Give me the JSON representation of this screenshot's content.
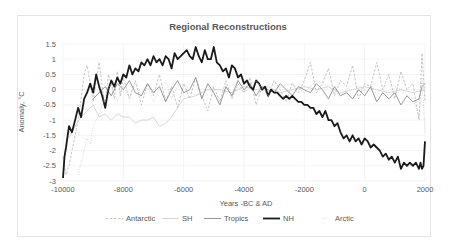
{
  "chart_data": {
    "type": "line",
    "title": "Regional Reconstructions",
    "xlabel": "Years -BC & AD",
    "ylabel": "Anomaly, °C",
    "xlim": [
      -10000,
      2000
    ],
    "ylim": [
      -3,
      1.5
    ],
    "x_ticks": [
      -10000,
      -8000,
      -6000,
      -4000,
      -2000,
      0,
      2000
    ],
    "x_tick_labels": [
      "-10000",
      "-8000",
      "-6000",
      "-4000",
      "-2000",
      "0",
      "2000"
    ],
    "y_ticks": [
      1.5,
      1,
      0.5,
      0,
      -0.5,
      -1,
      -1.5,
      -2,
      -2.5,
      -3
    ],
    "y_tick_labels": [
      "1.5",
      "1",
      "0.5",
      "0",
      "-0.5",
      "-1",
      "-1.5",
      "-2",
      "-2.5",
      "-3"
    ],
    "grid": {
      "horizontal": true,
      "vertical": true,
      "color": "#ececec"
    },
    "legend_position": "bottom",
    "series": [
      {
        "name": "Antarctic",
        "style": "dashed",
        "color": "#b8b8b8",
        "width": 0.8,
        "x": [
          -10000,
          -9900,
          -9800,
          -9700,
          -9600,
          -9500,
          -9400,
          -9300,
          -9200,
          -9100,
          -9000,
          -8900,
          -8800,
          -8700,
          -8600,
          -8500,
          -8400,
          -8300,
          -8200,
          -8100,
          -8000,
          -7800,
          -7600,
          -7400,
          -7200,
          -7000,
          -6800,
          -6600,
          -6400,
          -6200,
          -6000,
          -5800,
          -5600,
          -5400,
          -5200,
          -5000,
          -4800,
          -4600,
          -4400,
          -4200,
          -4000,
          -3800,
          -3600,
          -3400,
          -3200,
          -3000,
          -2800,
          -2600,
          -2400,
          -2200,
          -2000,
          -1800,
          -1600,
          -1400,
          -1200,
          -1000,
          -800,
          -600,
          -400,
          -200,
          0,
          200,
          400,
          600,
          800,
          1000,
          1200,
          1400,
          1600,
          1800,
          1900,
          2000
        ],
        "y": [
          -2.2,
          -2.8,
          -2.5,
          -2.0,
          -1.5,
          -1.0,
          -0.3,
          0.5,
          0.8,
          0.2,
          -0.4,
          0.3,
          0.9,
          0.1,
          -0.6,
          0.5,
          0.2,
          -0.3,
          0.6,
          -0.2,
          0.4,
          -0.3,
          0.3,
          -0.5,
          0.2,
          -0.2,
          0.5,
          -0.4,
          0.1,
          -0.6,
          0.2,
          -0.3,
          0.4,
          -0.2,
          -0.7,
          0.1,
          -0.4,
          0.3,
          -0.3,
          0.2,
          -0.1,
          0.4,
          -0.5,
          0.1,
          -0.2,
          0.3,
          0.0,
          -0.4,
          0.2,
          -0.1,
          0.3,
          0.9,
          -0.1,
          0.2,
          0.7,
          -0.2,
          0.3,
          0.1,
          0.8,
          -0.3,
          0.2,
          0.1,
          0.9,
          0.0,
          0.5,
          -0.3,
          0.6,
          0.0,
          0.2,
          -1.0,
          1.2,
          -0.4
        ]
      },
      {
        "name": "SH",
        "style": "solid",
        "color": "#d3d3d3",
        "width": 0.9,
        "x": [
          -9800,
          -9600,
          -9400,
          -9200,
          -9000,
          -8800,
          -8600,
          -8400,
          -8200,
          -8000,
          -7800,
          -7600,
          -7400,
          -7200,
          -7000,
          -6800,
          -6600,
          -6400,
          -6200,
          -6000,
          -5600,
          -5200,
          -4800,
          -4400,
          -4000,
          -3600,
          -3200,
          -2800,
          -2400,
          -2000,
          -1600,
          -1200,
          -800,
          -400,
          0,
          400,
          800,
          1200,
          1600,
          2000
        ],
        "y": [
          -1.6,
          -1.2,
          -0.9,
          -0.7,
          -0.5,
          -0.9,
          -0.8,
          -1.0,
          -0.8,
          -0.9,
          -0.9,
          -1.1,
          -1.0,
          -1.0,
          -0.9,
          -1.2,
          -1.1,
          -0.9,
          -0.6,
          -0.3,
          -0.2,
          0.0,
          0.0,
          -0.1,
          0.1,
          0.0,
          0.1,
          -0.1,
          0.0,
          0.1,
          0.0,
          0.1,
          -0.1,
          0.0,
          0.1,
          0.0,
          -0.1,
          0.0,
          -0.1,
          0.0
        ]
      },
      {
        "name": "Tropics",
        "style": "solid",
        "color": "#8c8c8c",
        "width": 0.9,
        "x": [
          -9000,
          -8800,
          -8600,
          -8400,
          -8200,
          -8000,
          -7800,
          -7600,
          -7400,
          -7200,
          -7000,
          -6800,
          -6600,
          -6400,
          -6200,
          -6000,
          -5800,
          -5600,
          -5400,
          -5200,
          -5000,
          -4800,
          -4600,
          -4400,
          -4200,
          -4000,
          -3800,
          -3600,
          -3400,
          -3200,
          -3000,
          -2800,
          -2600,
          -2400,
          -2200,
          -2000,
          -1800,
          -1600,
          -1400,
          -1200,
          -1000,
          -800,
          -600,
          -400,
          -200,
          0,
          200,
          400,
          600,
          800,
          1000,
          1200,
          1400,
          1600,
          1800,
          1900,
          2000
        ],
        "y": [
          -0.3,
          -0.1,
          0.1,
          -0.2,
          0.2,
          0.0,
          0.3,
          -0.1,
          -0.2,
          0.2,
          -0.1,
          0.1,
          -0.4,
          0.0,
          0.3,
          -0.1,
          0.0,
          0.4,
          -0.3,
          0.2,
          -0.1,
          -0.5,
          0.1,
          -0.2,
          0.3,
          0.0,
          0.2,
          -0.2,
          0.1,
          0.0,
          -0.1,
          0.2,
          0.0,
          -0.2,
          0.1,
          0.0,
          -0.1,
          0.2,
          0.0,
          -0.3,
          0.1,
          -0.2,
          -0.1,
          -0.3,
          0.0,
          -0.2,
          0.1,
          -0.4,
          -0.1,
          -0.3,
          -0.1,
          -0.5,
          -0.2,
          -0.4,
          -0.3,
          0.1,
          0.2
        ]
      },
      {
        "name": "NH",
        "style": "solid",
        "color": "#1a1a1a",
        "width": 1.8,
        "x": [
          -10000,
          -9950,
          -9900,
          -9800,
          -9700,
          -9600,
          -9500,
          -9400,
          -9300,
          -9200,
          -9100,
          -9000,
          -8900,
          -8800,
          -8700,
          -8600,
          -8500,
          -8400,
          -8300,
          -8200,
          -8100,
          -8000,
          -7900,
          -7800,
          -7700,
          -7600,
          -7500,
          -7400,
          -7300,
          -7200,
          -7100,
          -7000,
          -6900,
          -6800,
          -6700,
          -6600,
          -6500,
          -6400,
          -6300,
          -6200,
          -6100,
          -6000,
          -5900,
          -5800,
          -5700,
          -5600,
          -5500,
          -5400,
          -5300,
          -5200,
          -5100,
          -5000,
          -4900,
          -4800,
          -4700,
          -4600,
          -4500,
          -4400,
          -4300,
          -4200,
          -4100,
          -4000,
          -3900,
          -3800,
          -3700,
          -3600,
          -3500,
          -3400,
          -3300,
          -3200,
          -3100,
          -3000,
          -2900,
          -2800,
          -2700,
          -2600,
          -2500,
          -2400,
          -2300,
          -2200,
          -2100,
          -2000,
          -1900,
          -1800,
          -1700,
          -1600,
          -1500,
          -1400,
          -1300,
          -1200,
          -1100,
          -1000,
          -900,
          -800,
          -700,
          -600,
          -500,
          -400,
          -300,
          -200,
          -100,
          0,
          100,
          200,
          300,
          400,
          500,
          600,
          700,
          800,
          900,
          1000,
          1100,
          1200,
          1300,
          1400,
          1500,
          1600,
          1700,
          1800,
          1850,
          1900,
          1950,
          2000
        ],
        "y": [
          -2.9,
          -2.2,
          -1.9,
          -1.2,
          -1.4,
          -1.0,
          -0.6,
          -0.9,
          -0.3,
          -0.1,
          0.2,
          -0.1,
          0.5,
          0.1,
          -0.2,
          -0.6,
          0.0,
          0.3,
          0.1,
          0.4,
          0.2,
          0.5,
          0.4,
          0.8,
          0.5,
          0.7,
          0.6,
          0.9,
          0.8,
          1.0,
          0.8,
          1.1,
          0.9,
          1.0,
          0.8,
          1.1,
          1.0,
          0.7,
          1.2,
          1.0,
          1.1,
          1.2,
          1.3,
          1.1,
          1.0,
          1.4,
          1.1,
          0.9,
          1.3,
          1.0,
          1.0,
          1.4,
          0.9,
          0.8,
          0.6,
          0.7,
          0.4,
          0.8,
          0.7,
          0.4,
          0.5,
          0.2,
          0.3,
          0.1,
          0.0,
          0.3,
          0.2,
          0.0,
          0.1,
          -0.2,
          0.0,
          -0.1,
          -0.1,
          -0.2,
          -0.3,
          -0.2,
          -0.3,
          -0.2,
          -0.3,
          -0.4,
          -0.4,
          -0.5,
          -0.5,
          -0.6,
          -0.6,
          -0.8,
          -0.7,
          -0.9,
          -0.7,
          -1.0,
          -1.0,
          -1.2,
          -1.1,
          -1.4,
          -1.6,
          -1.5,
          -1.7,
          -1.5,
          -1.7,
          -1.6,
          -1.8,
          -1.6,
          -1.7,
          -1.9,
          -1.8,
          -1.9,
          -2.0,
          -2.2,
          -2.1,
          -2.3,
          -2.2,
          -2.4,
          -2.2,
          -2.6,
          -2.4,
          -2.5,
          -2.4,
          -2.5,
          -2.4,
          -2.6,
          -2.4,
          -2.6,
          -2.5,
          -1.7
        ]
      },
      {
        "name": "Arctic",
        "style": "dotted",
        "color": "#c4c4c4",
        "width": 0.8,
        "x": [
          -9500,
          -9400,
          -9300,
          -9200,
          -9100,
          -9000,
          -8800,
          -8600,
          -8400,
          -8200,
          -8000,
          -7800,
          -7600,
          -7400,
          -7200,
          -7000,
          -6800,
          -6600,
          -6400,
          -6200,
          -6000,
          -5600,
          -5200,
          -4800,
          -4400,
          -4000,
          -3600,
          -3200,
          -2800,
          -2400,
          -2000,
          -1600,
          -1200,
          -800,
          -400,
          0,
          400,
          800,
          1200,
          1600,
          1800,
          1900,
          2000
        ],
        "y": [
          -2.8,
          -2.4,
          -2.0,
          -1.6,
          -1.8,
          -1.2,
          -0.8,
          -0.2,
          0.2,
          -0.4,
          0.1,
          -0.3,
          0.2,
          -0.2,
          0.1,
          -0.4,
          0.0,
          0.3,
          -0.3,
          0.1,
          0.2,
          -0.2,
          0.1,
          -0.3,
          0.2,
          -0.1,
          0.3,
          -0.2,
          0.1,
          0.2,
          -0.1,
          0.3,
          0.1,
          -0.2,
          0.2,
          0.0,
          -0.1,
          0.2,
          0.0,
          -0.3,
          -0.9,
          0.4,
          -1.4
        ]
      }
    ]
  }
}
